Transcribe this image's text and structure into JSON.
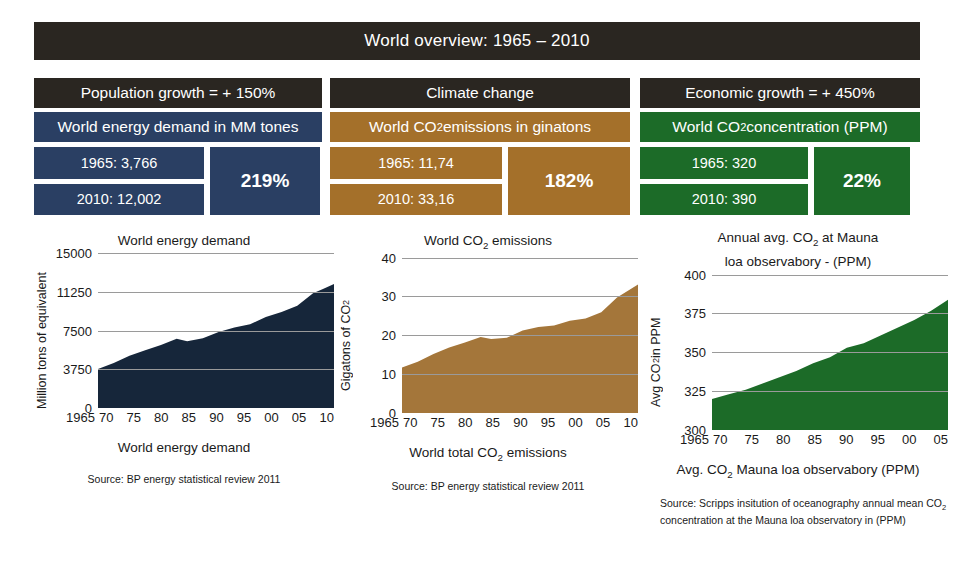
{
  "banner": {
    "title": "World overview: 1965 – 2010"
  },
  "columns": [
    {
      "category": "Population growth = + 150%",
      "metric": "World energy demand in MM tones",
      "value_1965": "1965: 3,766",
      "value_2010": "2010: 12,002",
      "percent": "219%",
      "color": "#2a3f63"
    },
    {
      "category": "Climate change",
      "metric_pre": "World CO",
      "metric_sub": "2",
      "metric_post": " emissions in ginatons",
      "value_1965": "1965: 11,74",
      "value_2010": "2010: 33,16",
      "percent": "182%",
      "color": "#a4702a"
    },
    {
      "category": "Economic growth = + 450%",
      "metric_pre": "World CO",
      "metric_sub": "2",
      "metric_post": "  concentration (PPM)",
      "value_1965": "1965: 320",
      "value_2010": "2010: 390",
      "percent": "22%",
      "color": "#1c6b28"
    }
  ],
  "chart_data": [
    {
      "type": "area",
      "title": "World energy demand",
      "title_line2": "",
      "ylabel": "Million tons of equivalent",
      "xlabel": "",
      "caption": "World energy demand",
      "source": "Source: BP energy statistical review 2011",
      "color": "#16263a",
      "ylim": [
        0,
        15000
      ],
      "yticks": [
        0,
        3750,
        7500,
        11250,
        15000
      ],
      "ytick_labels": [
        "0",
        "3750",
        "7500",
        "11250",
        "15000"
      ],
      "grid": true,
      "x": [
        1965,
        1970,
        1975,
        1980,
        1985,
        1990,
        1995,
        2000,
        2005,
        2010
      ],
      "xtick_labels": [
        "1965",
        "70",
        "75",
        "80",
        "85",
        "90",
        "95",
        "00",
        "05",
        "10"
      ],
      "values": [
        3766,
        4800,
        5750,
        6700,
        6600,
        7650,
        8300,
        9300,
        10900,
        12002
      ],
      "series_detail": [
        {
          "year": 1965,
          "value": 3766
        },
        {
          "year": 1968,
          "value": 4350
        },
        {
          "year": 1971,
          "value": 5050
        },
        {
          "year": 1974,
          "value": 5600
        },
        {
          "year": 1977,
          "value": 6100
        },
        {
          "year": 1980,
          "value": 6700
        },
        {
          "year": 1982,
          "value": 6450
        },
        {
          "year": 1985,
          "value": 6750
        },
        {
          "year": 1988,
          "value": 7350
        },
        {
          "year": 1991,
          "value": 7800
        },
        {
          "year": 1994,
          "value": 8100
        },
        {
          "year": 1997,
          "value": 8800
        },
        {
          "year": 2000,
          "value": 9300
        },
        {
          "year": 2003,
          "value": 9900
        },
        {
          "year": 2006,
          "value": 11100
        },
        {
          "year": 2008,
          "value": 11550
        },
        {
          "year": 2010,
          "value": 12002
        }
      ]
    },
    {
      "type": "area",
      "title_pre": "World CO",
      "title_sub": "2",
      "title_post": " emissions",
      "ylabel_pre": "Gigatons of CO",
      "ylabel_sub": "2",
      "caption_pre": "World total CO",
      "caption_sub": "2",
      "caption_post": " emissions",
      "source": "Source: BP energy statistical review 2011",
      "color": "#a4763a",
      "ylim": [
        0,
        40
      ],
      "yticks": [
        0,
        10,
        20,
        30,
        40
      ],
      "ytick_labels": [
        "0",
        "10",
        "20",
        "30",
        "40"
      ],
      "grid": true,
      "x": [
        1965,
        1970,
        1975,
        1980,
        1985,
        1990,
        1995,
        2000,
        2005,
        2010
      ],
      "xtick_labels": [
        "1965",
        "70",
        "75",
        "80",
        "85",
        "90",
        "95",
        "00",
        "05",
        "10"
      ],
      "values": [
        11.74,
        14.5,
        17.0,
        19.5,
        19.3,
        22.0,
        23.0,
        24.5,
        29.0,
        33.16
      ],
      "series_detail": [
        {
          "year": 1965,
          "value": 11.74
        },
        {
          "year": 1968,
          "value": 13.2
        },
        {
          "year": 1971,
          "value": 15.2
        },
        {
          "year": 1974,
          "value": 16.9
        },
        {
          "year": 1977,
          "value": 18.2
        },
        {
          "year": 1980,
          "value": 19.6
        },
        {
          "year": 1982,
          "value": 19.1
        },
        {
          "year": 1985,
          "value": 19.4
        },
        {
          "year": 1988,
          "value": 21.3
        },
        {
          "year": 1991,
          "value": 22.2
        },
        {
          "year": 1994,
          "value": 22.6
        },
        {
          "year": 1997,
          "value": 23.8
        },
        {
          "year": 2000,
          "value": 24.4
        },
        {
          "year": 2003,
          "value": 26.0
        },
        {
          "year": 2006,
          "value": 29.8
        },
        {
          "year": 2008,
          "value": 31.5
        },
        {
          "year": 2010,
          "value": 33.16
        }
      ]
    },
    {
      "type": "area",
      "title_pre": "Annual avg. CO",
      "title_sub": "2",
      "title_post": " at Mauna",
      "title_line2": "loa observabory - (PPM)",
      "ylabel_pre": "Avg CO",
      "ylabel_sub": "2",
      "ylabel_post": " in PPM",
      "caption_pre": "Avg. CO",
      "caption_sub": "2",
      "caption_post": " Mauna loa observabory (PPM)",
      "source": "Source: Scripps insitution of oceanography annual mean CO2 concentration at the Mauna loa observatory in (PPM)",
      "source_pre": "Source: Scripps insitution of oceanography annual mean CO",
      "source_sub": "2",
      "source_post": " concentration at the Mauna loa observatory in (PPM)",
      "color": "#1c6b28",
      "ylim": [
        300,
        400
      ],
      "yticks": [
        300,
        325,
        350,
        375,
        400
      ],
      "ytick_labels": [
        "300",
        "325",
        "350",
        "375",
        "400"
      ],
      "grid": true,
      "x": [
        1965,
        1970,
        1975,
        1980,
        1985,
        1990,
        1995,
        2000,
        2005
      ],
      "xtick_labels": [
        "1965",
        "70",
        "75",
        "80",
        "85",
        "90",
        "95",
        "00",
        "05"
      ],
      "values": [
        320,
        325,
        331,
        338,
        345,
        354,
        360,
        369,
        380
      ],
      "series_detail": [
        {
          "year": 1965,
          "value": 320
        },
        {
          "year": 1968,
          "value": 323
        },
        {
          "year": 1971,
          "value": 326
        },
        {
          "year": 1974,
          "value": 330
        },
        {
          "year": 1977,
          "value": 334
        },
        {
          "year": 1980,
          "value": 338
        },
        {
          "year": 1983,
          "value": 343
        },
        {
          "year": 1986,
          "value": 347
        },
        {
          "year": 1989,
          "value": 353
        },
        {
          "year": 1992,
          "value": 356
        },
        {
          "year": 1995,
          "value": 361
        },
        {
          "year": 1998,
          "value": 366
        },
        {
          "year": 2001,
          "value": 371
        },
        {
          "year": 2004,
          "value": 377
        },
        {
          "year": 2007,
          "value": 384
        }
      ]
    }
  ]
}
